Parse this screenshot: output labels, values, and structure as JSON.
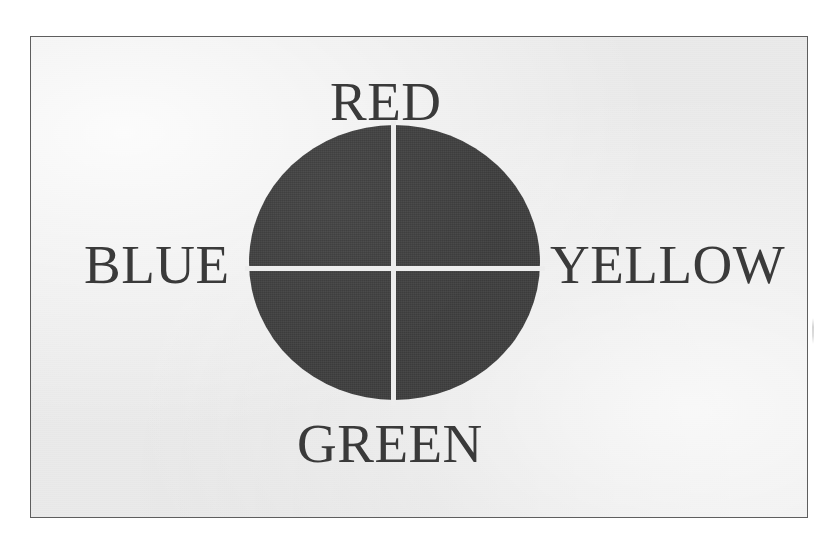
{
  "figure": {
    "kind": "quadrant-circle-diagram",
    "plate_background_color": "#eaeaea",
    "plate_border_color": "#5e5e5e",
    "page_background_color": "#ffffff",
    "disc_fill_color": "#3f3f3f",
    "divider_color": "#ededed",
    "label_color": "#3a3a3a"
  },
  "labels": {
    "top": "RED",
    "left": "BLUE",
    "right": "YELLOW",
    "bottom": "GREEN"
  },
  "chart_data": {
    "type": "pie",
    "title": "",
    "subtitle": "",
    "xlabel": "",
    "ylabel": "",
    "legend_position": "around-slices",
    "grid": false,
    "categories": [
      "RED",
      "YELLOW",
      "GREEN",
      "BLUE"
    ],
    "values": [
      25,
      25,
      25,
      25
    ],
    "slice_labels_position": [
      "top",
      "right",
      "bottom",
      "left"
    ],
    "slice_colors": [
      "#3f3f3f",
      "#3f3f3f",
      "#3f3f3f",
      "#3f3f3f"
    ],
    "annotations": [
      "Circle divided into four equal quadrants by a white vertical and a white horizontal line",
      "Quadrant names are placed outside the circle at the 12, 3, 6 and 9 o'clock positions"
    ]
  }
}
